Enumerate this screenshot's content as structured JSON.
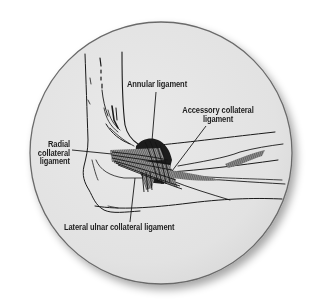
{
  "figure": {
    "colors": {
      "page_background": "#ffffff",
      "circle_fill": "#e4e4e4",
      "circle_border": "#6a6a6a",
      "line_art": "#1a1a1a",
      "label_text": "#1e1e1e"
    },
    "labels": {
      "annular": {
        "lines": [
          "Annular ligament"
        ]
      },
      "accessory": {
        "lines": [
          "Accessory collateral",
          "ligament"
        ]
      },
      "radial": {
        "lines": [
          "Radial",
          "collateral",
          "ligament"
        ]
      },
      "lateral_ulnar": {
        "lines": [
          "Lateral ulnar collateral ligament"
        ]
      }
    }
  }
}
